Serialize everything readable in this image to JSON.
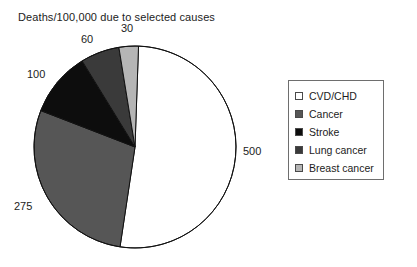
{
  "chart_data": {
    "type": "pie",
    "title": "Deaths/100,000 due to selected causes",
    "xlabel": "",
    "ylabel": "",
    "legend_position": "right",
    "grid": false,
    "total": 965,
    "categories": [
      "CVD/CHD",
      "Cancer",
      "Stroke",
      "Lung cancer",
      "Breast cancer"
    ],
    "values": [
      500,
      275,
      100,
      60,
      30
    ],
    "labels": [
      "500",
      "275",
      "100",
      "60",
      "30"
    ],
    "colors": [
      "#ffffff",
      "#565656",
      "#0d0d0d",
      "#3a3a3a",
      "#b5b5b5"
    ],
    "slices": [
      {
        "name": "CVD/CHD",
        "value": 500,
        "label": "500",
        "color": "#ffffff"
      },
      {
        "name": "Cancer",
        "value": 275,
        "label": "275",
        "color": "#565656"
      },
      {
        "name": "Stroke",
        "value": 100,
        "label": "100",
        "color": "#0d0d0d"
      },
      {
        "name": "Lung cancer",
        "value": 60,
        "label": "60",
        "color": "#3a3a3a"
      },
      {
        "name": "Breast cancer",
        "value": 30,
        "label": "30",
        "color": "#b5b5b5"
      }
    ]
  },
  "legend": {
    "items": [
      {
        "label": "CVD/CHD",
        "color": "#ffffff"
      },
      {
        "label": "Cancer",
        "color": "#565656"
      },
      {
        "label": "Stroke",
        "color": "#0d0d0d"
      },
      {
        "label": "Lung cancer",
        "color": "#3a3a3a"
      },
      {
        "label": "Breast cancer",
        "color": "#b5b5b5"
      }
    ]
  },
  "geometry": {
    "cx": 135,
    "cy": 147,
    "r": 101,
    "start_angle_deg": -88,
    "outline": "#111111"
  }
}
